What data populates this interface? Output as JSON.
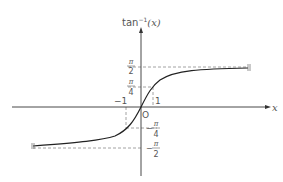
{
  "figure": {
    "function_label": "tan⁻¹(x)",
    "y_axis_label_main": "tan",
    "y_axis_label_exp": "−1",
    "y_axis_label_arg": "(x)",
    "x_axis_label": "x",
    "origin_label": "O",
    "x_ticks": [
      {
        "label": "−1",
        "value": -1
      },
      {
        "label": "1",
        "value": 1
      }
    ],
    "y_ticks": [
      {
        "num": "π",
        "den": "2",
        "sign": "",
        "value": "pi/2"
      },
      {
        "num": "π",
        "den": "4",
        "sign": "",
        "value": "pi/4"
      },
      {
        "num": "π",
        "den": "4",
        "sign": "−",
        "value": "-pi/4"
      },
      {
        "num": "π",
        "den": "2",
        "sign": "−",
        "value": "-pi/2"
      }
    ],
    "asymptotes": [
      "y = π/2",
      "y = −π/2"
    ],
    "curve_color": "#222222",
    "axis_color": "#333333",
    "guide_color": "#888888"
  }
}
